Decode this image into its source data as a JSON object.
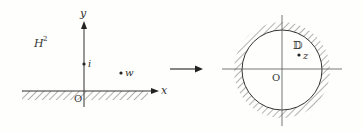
{
  "left_panel": {
    "region_label": "H",
    "region_superscript": "2",
    "y_axis_label": "y",
    "x_axis_label": "x",
    "origin_label": "O",
    "points": [
      {
        "label": "i"
      },
      {
        "label": "w"
      }
    ]
  },
  "mapping_arrow": {
    "direction": "right"
  },
  "right_panel": {
    "region_label": "𝔻",
    "origin_label": "O",
    "points": [
      {
        "label": "z"
      }
    ]
  },
  "colors": {
    "ink": "#333333",
    "hatch": "#666666",
    "background": "#fefefc"
  }
}
